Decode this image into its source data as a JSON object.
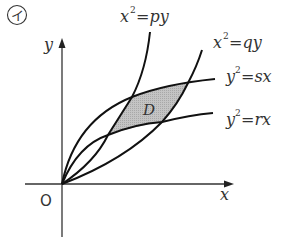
{
  "figure": {
    "panel_label": "イ",
    "axes": {
      "x_label": "x",
      "y_label": "y",
      "origin_label": "O"
    },
    "curves": [
      {
        "id": "x2-py",
        "label_lhs": "x",
        "label_exp": "2",
        "label_rhs": "=py"
      },
      {
        "id": "x2-qy",
        "label_lhs": "x",
        "label_exp": "2",
        "label_rhs": "=qy"
      },
      {
        "id": "y2-sx",
        "label_lhs": "y",
        "label_exp": "2",
        "label_rhs": "=sx"
      },
      {
        "id": "y2-rx",
        "label_lhs": "y",
        "label_exp": "2",
        "label_rhs": "=rx"
      }
    ],
    "region_label": "D",
    "colors": {
      "curve": "#111111",
      "axis": "#333333",
      "region_fill": "#b8b8b8"
    }
  }
}
